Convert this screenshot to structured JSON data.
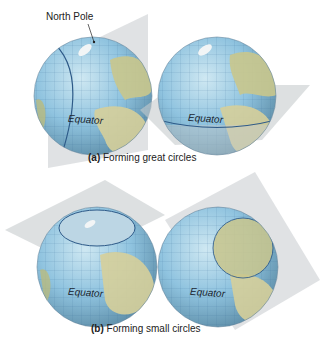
{
  "figure": {
    "panel_a": {
      "caption_letter": "(a)",
      "caption_text": "Forming great circles",
      "globes": [
        {
          "label": "Equator",
          "callout": "North Pole",
          "plane": "vertical great-circle plane through poles"
        },
        {
          "label": "Equator",
          "plane": "horizontal plane through equator"
        }
      ]
    },
    "panel_b": {
      "caption_letter": "(b)",
      "caption_text": "Forming small circles",
      "globes": [
        {
          "label": "Equator",
          "plane": "horizontal plane cutting northern cap"
        },
        {
          "label": "Equator",
          "plane": "tilted plane cutting Europe region"
        }
      ]
    },
    "colors": {
      "ocean": "#8fc3df",
      "land": "#c9c68c",
      "plane": "#b9bfc2",
      "circle_line": "#2e5a88"
    }
  }
}
